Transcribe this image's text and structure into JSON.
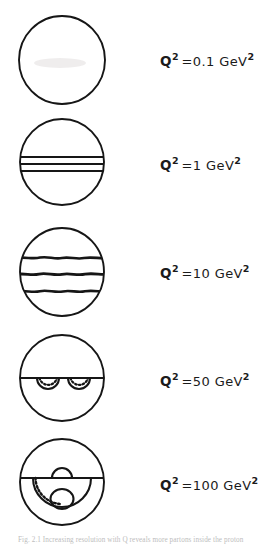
{
  "figure": {
    "caption_partial": "Fig. 2.1  Increasing resolution with Q   reveals more partons inside the proton",
    "rows": [
      {
        "id": "row-0",
        "label": {
          "symbol": "Q",
          "symbol_exp": "2",
          "relation": "=",
          "value": "0.1",
          "unit": "GeV",
          "unit_exp": "2"
        },
        "q2_value": 0.1,
        "unit": "GeV^2",
        "diagram": {
          "name": "empty-proton-blob",
          "description": "plain circle with faint smudge, no internal structure",
          "features": []
        }
      },
      {
        "id": "row-1",
        "label": {
          "symbol": "Q",
          "symbol_exp": "2",
          "relation": "=",
          "value": "1",
          "unit": "GeV",
          "unit_exp": "2"
        },
        "q2_value": 1,
        "unit": "GeV^2",
        "diagram": {
          "name": "three-straight-valence-lines",
          "description": "circle containing three closely spaced straight horizontal lines",
          "features": [
            "straight-line",
            "straight-line",
            "straight-line"
          ]
        }
      },
      {
        "id": "row-2",
        "label": {
          "symbol": "Q",
          "symbol_exp": "2",
          "relation": "=",
          "value": "10",
          "unit": "GeV",
          "unit_exp": "2"
        },
        "q2_value": 10,
        "unit": "GeV^2",
        "diagram": {
          "name": "three-wavy-quark-lines",
          "description": "circle containing three thick rough wavy horizontal lines, widely spaced",
          "features": [
            "wavy-line",
            "wavy-line",
            "wavy-line"
          ]
        }
      },
      {
        "id": "row-3",
        "label": {
          "symbol": "Q",
          "symbol_exp": "2",
          "relation": "=",
          "value": "50",
          "unit": "GeV",
          "unit_exp": "2"
        },
        "q2_value": 50,
        "unit": "GeV^2",
        "diagram": {
          "name": "two-gluon-loops-on-line",
          "description": "circle with one horizontal line and two downward hanging loops with dashed gluon arcs",
          "features": [
            "horizontal-line",
            "loop",
            "loop"
          ]
        }
      },
      {
        "id": "row-4",
        "label": {
          "symbol": "Q",
          "symbol_exp": "2",
          "relation": "=",
          "value": "100",
          "unit": "GeV",
          "unit_exp": "2"
        },
        "q2_value": 100,
        "unit": "GeV^2",
        "diagram": {
          "name": "sea-quark-gluon-structure",
          "description": "circle with horizontal line, small arc bump above line, large dashed arc below, and small sea-quark circle at bottom",
          "features": [
            "horizontal-line",
            "small-arc-above",
            "large-dashed-arc-below",
            "small-circle"
          ]
        }
      }
    ]
  },
  "colors": {
    "ink": "#161616",
    "background": "#ffffff",
    "smudge": "#eceaea",
    "caption": "#bdbdbd"
  }
}
